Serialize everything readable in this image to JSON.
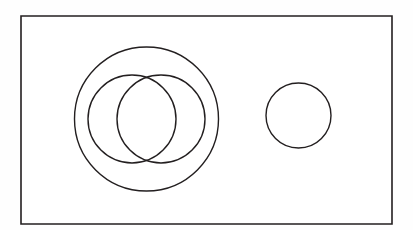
{
  "page": {
    "background_color": "#ffffff",
    "canvas_color": "#fefefe",
    "width": 413,
    "height": 230
  },
  "diagram": {
    "name": "nested-and-overlapping-circles",
    "stroke_color": "#231f20",
    "fill_color": "none",
    "frame": {
      "label": "bounding-rectangle",
      "x": 21,
      "y": 16,
      "width": 371,
      "height": 208,
      "stroke_width": 1.6
    },
    "shapes": [
      {
        "id": "outer-circle",
        "label": "Large enclosing circle",
        "cx": 146.5,
        "cy": 119,
        "r": 72,
        "stroke_width": 1.4
      },
      {
        "id": "inner-circle-left",
        "label": "Left overlapping circle",
        "cx": 132,
        "cy": 119,
        "r": 44,
        "stroke_width": 1.4
      },
      {
        "id": "inner-circle-right",
        "label": "Right overlapping circle",
        "cx": 161,
        "cy": 119,
        "r": 44,
        "stroke_width": 1.4
      },
      {
        "id": "separate-circle",
        "label": "Separate small circle",
        "cx": 298.5,
        "cy": 115.5,
        "r": 32.5,
        "stroke_width": 1.4
      }
    ]
  }
}
